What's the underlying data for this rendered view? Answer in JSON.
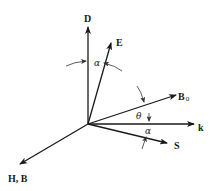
{
  "diagram": {
    "type": "vector-diagram",
    "origin": {
      "x": 88,
      "y": 124
    },
    "vectors": [
      {
        "id": "D",
        "label": "D",
        "tip": {
          "x": 88,
          "y": 27
        },
        "label_pos": {
          "x": 84,
          "y": 22
        }
      },
      {
        "id": "E",
        "label": "E",
        "tip": {
          "x": 111,
          "y": 43
        },
        "label_pos": {
          "x": 116,
          "y": 46
        }
      },
      {
        "id": "B0",
        "label": "B",
        "subscript": "0",
        "tip": {
          "x": 176,
          "y": 95
        },
        "label_pos": {
          "x": 178,
          "y": 100
        }
      },
      {
        "id": "k",
        "label": "k",
        "tip": {
          "x": 194,
          "y": 124
        },
        "label_pos": {
          "x": 198,
          "y": 131
        }
      },
      {
        "id": "S",
        "label": "S",
        "tip": {
          "x": 167,
          "y": 143
        },
        "label_pos": {
          "x": 174,
          "y": 149
        }
      },
      {
        "id": "HB",
        "label": "H, B",
        "tip": {
          "x": 20,
          "y": 164
        },
        "label_pos": {
          "x": 8,
          "y": 182
        }
      }
    ],
    "angles": [
      {
        "id": "alpha-top",
        "symbol": "α",
        "between": [
          "D",
          "E"
        ],
        "pos": {
          "x": 94,
          "y": 65
        }
      },
      {
        "id": "theta",
        "symbol": "θ",
        "between": [
          "B0",
          "k"
        ],
        "pos": {
          "x": 136,
          "y": 118
        }
      },
      {
        "id": "alpha-bottom",
        "symbol": "α",
        "between": [
          "k",
          "S"
        ],
        "pos": {
          "x": 145,
          "y": 133
        }
      }
    ],
    "colors": {
      "ink": "#1a1a1a",
      "background": "#ffffff"
    }
  }
}
